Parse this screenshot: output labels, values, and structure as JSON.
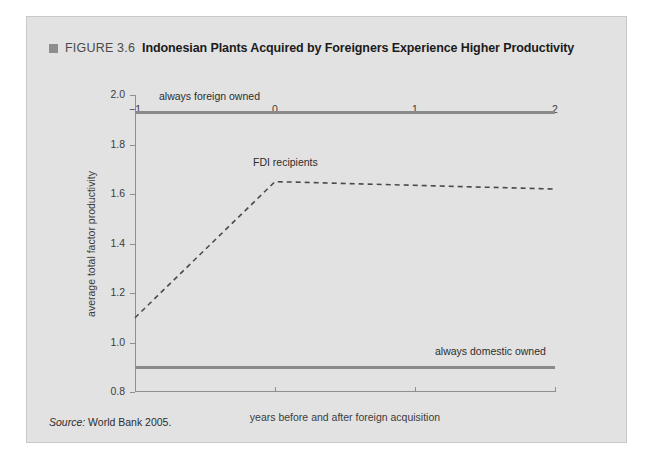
{
  "figure": {
    "bullet_icon": "square-bullet-icon",
    "number": "FIGURE 3.6",
    "title": "Indonesian Plants Acquired by Foreigners Experience Higher Productivity",
    "source_label": "Source:",
    "source_text": "World Bank 2005."
  },
  "chart_data": {
    "type": "line",
    "title": "Indonesian Plants Acquired by Foreigners Experience Higher Productivity",
    "xlabel": "years before and after foreign acquisition",
    "ylabel": "average total factor productivity",
    "xlim": [
      -1.0,
      2.0
    ],
    "ylim": [
      0.8,
      2.0
    ],
    "xticks": [
      -1,
      0,
      1,
      2
    ],
    "xticklabels": [
      "−1",
      "0",
      "1",
      "2"
    ],
    "yticks": [
      0.8,
      1.0,
      1.2,
      1.4,
      1.6,
      1.8,
      2.0
    ],
    "yticklabels": [
      "0.8",
      "1.0",
      "1.2",
      "1.4",
      "1.6",
      "1.8",
      "2.0"
    ],
    "grid": false,
    "legend": "inline-annotations",
    "series": [
      {
        "name": "always foreign owned",
        "style": "solid",
        "color": "#8a8a8a",
        "x": [
          -1,
          2
        ],
        "values": [
          1.93,
          1.93
        ],
        "label_position": "above-left"
      },
      {
        "name": "FDI recipients",
        "style": "dashed",
        "color": "#4a4a4a",
        "x": [
          -1,
          0,
          2
        ],
        "values": [
          1.1,
          1.65,
          1.62
        ],
        "label_position": "above-peak"
      },
      {
        "name": "always domestic owned",
        "style": "solid",
        "color": "#8a8a8a",
        "x": [
          -1,
          2
        ],
        "values": [
          0.9,
          0.9
        ],
        "label_position": "above-right"
      }
    ]
  }
}
